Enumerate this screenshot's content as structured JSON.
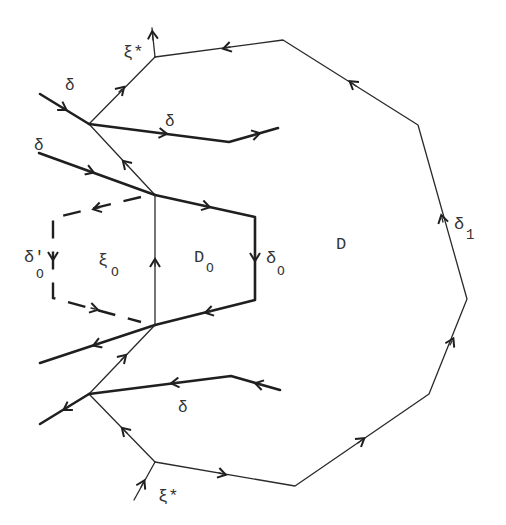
{
  "figure": {
    "type": "diagram",
    "labels": {
      "xi_star_top": "ξ*",
      "xi_star_bottom": "ξ*",
      "delta_upper_left": "δ",
      "delta_upper_mid": "δ",
      "delta_left": "δ",
      "delta_lower": "δ",
      "delta_prime_0": "δ'",
      "delta_prime_0_sub": "O",
      "xi_0": "ξ",
      "xi_0_sub": "O",
      "D_0": "D",
      "D_0_sub": "O",
      "delta_0": "δ",
      "delta_0_sub": "O",
      "D": "D",
      "delta_1": "δ",
      "delta_1_sub": "1"
    },
    "colors": {
      "ink": "#1f1f1f",
      "background": "#ffffff"
    }
  }
}
